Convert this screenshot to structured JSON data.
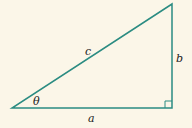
{
  "diagram": {
    "type": "right-triangle",
    "labels": {
      "hypotenuse": "c",
      "vertical_side": "b",
      "horizontal_side": "a",
      "angle": "θ"
    },
    "colors": {
      "background": "#fbf6e8",
      "line": "#2b8c82",
      "text": "#222222"
    },
    "right_angle_marker": true
  }
}
